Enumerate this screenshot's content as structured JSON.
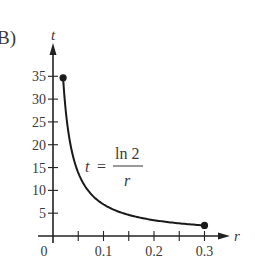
{
  "panel_label": "B)",
  "chart_data": {
    "type": "line",
    "title": "",
    "xlabel": "r",
    "ylabel": "t",
    "equation": {
      "lhs": "t",
      "equals": "=",
      "numerator": "ln 2",
      "denominator": "r"
    },
    "function": "t = ln(2) / r",
    "xlim": [
      0,
      0.3
    ],
    "ylim": [
      0,
      35
    ],
    "x_ticks": [
      0.05,
      0.1,
      0.15,
      0.2,
      0.25,
      0.3
    ],
    "x_tick_labels": [
      {
        "value": 0,
        "label": "0"
      },
      {
        "value": 0.1,
        "label": "0.1"
      },
      {
        "value": 0.2,
        "label": "0.2"
      },
      {
        "value": 0.3,
        "label": "0.3"
      }
    ],
    "y_ticks": [
      5,
      10,
      15,
      20,
      25,
      30,
      35
    ],
    "y_tick_labels": [
      "5",
      "10",
      "15",
      "20",
      "25",
      "30",
      "35"
    ],
    "endpoints": [
      {
        "r": 0.02,
        "t": 34.66
      },
      {
        "r": 0.3,
        "t": 2.31
      }
    ],
    "x": [
      0.02,
      0.025,
      0.03,
      0.04,
      0.05,
      0.06,
      0.08,
      0.1,
      0.12,
      0.15,
      0.18,
      0.2,
      0.22,
      0.25,
      0.28,
      0.3
    ],
    "values": [
      34.66,
      27.73,
      23.1,
      17.33,
      13.86,
      11.55,
      8.66,
      6.93,
      5.78,
      4.62,
      3.85,
      3.47,
      3.15,
      2.77,
      2.48,
      2.31
    ],
    "grid": false,
    "legend": null
  }
}
